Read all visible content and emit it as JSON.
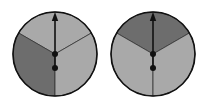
{
  "figure": {
    "colors": {
      "light": "#a9a9a9",
      "dark": "#6d6d6d",
      "outline": "#111111",
      "background": "#ffffff"
    },
    "spinners": [
      {
        "name": "left-spinner",
        "cx": 55,
        "cy": 54,
        "r": 42,
        "sectors": [
          {
            "name": "top",
            "shade": "light"
          },
          {
            "name": "lower-left",
            "shade": "dark"
          },
          {
            "name": "lower-right",
            "shade": "light"
          }
        ],
        "arrow": {
          "direction": "up"
        }
      },
      {
        "name": "right-spinner",
        "cx": 153,
        "cy": 54,
        "r": 42,
        "sectors": [
          {
            "name": "top",
            "shade": "dark"
          },
          {
            "name": "lower-left",
            "shade": "light"
          },
          {
            "name": "lower-right",
            "shade": "light"
          }
        ],
        "arrow": {
          "direction": "up"
        }
      }
    ]
  }
}
